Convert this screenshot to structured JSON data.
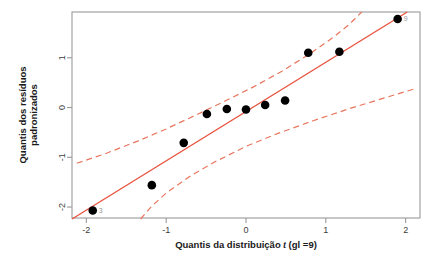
{
  "chart_data": {
    "type": "scatter",
    "title": "",
    "xlabel": "Quantis da distribuição t (gl =9)",
    "xlabel_parts": {
      "before": "Quantis da distribuição ",
      "italic": "t",
      "after": " (gl =9)"
    },
    "ylabel": "Quantis dos resíduos padronizados",
    "ylabel_line1": "Quantis dos resíduos",
    "ylabel_line2": "padronizados",
    "xlim": [
      -2.18,
      2.18
    ],
    "ylim": [
      -2.22,
      1.92
    ],
    "xticks": [
      -2,
      -1,
      0,
      1,
      2
    ],
    "xtick_labels": [
      "-2",
      "-1",
      "0",
      "1",
      "2"
    ],
    "yticks": [
      1,
      0,
      -1,
      -2
    ],
    "ytick_labels": [
      "1",
      "0",
      "-1",
      "-2"
    ],
    "grid": false,
    "legend": "none",
    "point_color": "#000000",
    "line_color": "#E8543F",
    "band_color": "#E8765E",
    "frame_color": "#9a9a9a",
    "points": [
      {
        "x": -1.92,
        "y": -2.07,
        "label": "3"
      },
      {
        "x": -1.18,
        "y": -1.56,
        "label": ""
      },
      {
        "x": -0.78,
        "y": -0.71,
        "label": ""
      },
      {
        "x": -0.49,
        "y": -0.13,
        "label": ""
      },
      {
        "x": -0.24,
        "y": -0.03,
        "label": ""
      },
      {
        "x": 0.0,
        "y": -0.04,
        "label": ""
      },
      {
        "x": 0.24,
        "y": 0.05,
        "label": ""
      },
      {
        "x": 0.49,
        "y": 0.14,
        "label": ""
      },
      {
        "x": 0.78,
        "y": 1.1,
        "label": ""
      },
      {
        "x": 1.17,
        "y": 1.12,
        "label": ""
      },
      {
        "x": 1.9,
        "y": 1.78,
        "label": "9"
      }
    ],
    "reference_line": {
      "x1": -2.18,
      "y1": -2.24,
      "x2": 2.02,
      "y2": 1.92
    },
    "upper_band": [
      {
        "x": -2.12,
        "y": -1.12
      },
      {
        "x": -1.75,
        "y": -0.92
      },
      {
        "x": -1.35,
        "y": -0.67
      },
      {
        "x": -1.0,
        "y": -0.43
      },
      {
        "x": -0.6,
        "y": -0.13
      },
      {
        "x": -0.25,
        "y": 0.14
      },
      {
        "x": 0.1,
        "y": 0.42
      },
      {
        "x": 0.45,
        "y": 0.73
      },
      {
        "x": 0.8,
        "y": 1.08
      },
      {
        "x": 1.1,
        "y": 1.42
      },
      {
        "x": 1.3,
        "y": 1.68
      },
      {
        "x": 1.45,
        "y": 1.92
      }
    ],
    "lower_band": [
      {
        "x": -1.32,
        "y": -2.24
      },
      {
        "x": -1.18,
        "y": -1.98
      },
      {
        "x": -1.0,
        "y": -1.72
      },
      {
        "x": -0.72,
        "y": -1.4
      },
      {
        "x": -0.4,
        "y": -1.1
      },
      {
        "x": 0.0,
        "y": -0.78
      },
      {
        "x": 0.4,
        "y": -0.52
      },
      {
        "x": 0.85,
        "y": -0.26
      },
      {
        "x": 1.3,
        "y": -0.02
      },
      {
        "x": 1.75,
        "y": 0.2
      },
      {
        "x": 2.12,
        "y": 0.38
      }
    ]
  }
}
